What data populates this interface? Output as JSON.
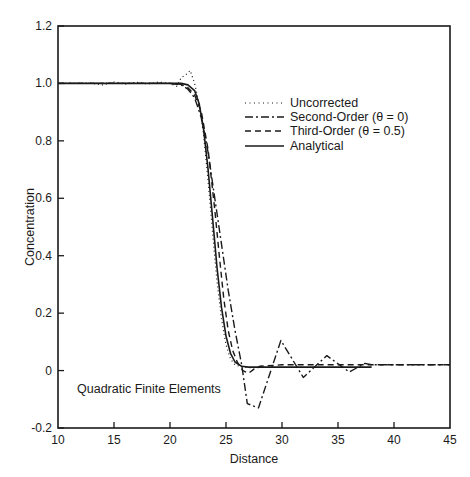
{
  "chart_data": {
    "type": "line",
    "title": "",
    "xlabel": "Distance",
    "ylabel": "Concentration",
    "xlim": [
      10,
      45
    ],
    "ylim": [
      -0.2,
      1.2
    ],
    "xticks": [
      10,
      15,
      20,
      25,
      30,
      35,
      40,
      45
    ],
    "xtick_labels": [
      "10",
      "15",
      "20",
      "25",
      "30",
      "35",
      "40",
      "45"
    ],
    "yticks": [
      -0.2,
      0,
      0.2,
      0.4,
      0.6,
      0.8,
      1.0,
      1.2
    ],
    "ytick_labels": [
      "-0.2",
      "0",
      "0.2",
      "0.4",
      "0.6",
      "0.8",
      "1.0",
      "1.2"
    ],
    "grid": false,
    "legend_position": "upper right (inside, mid-height)",
    "annotations": [
      "Quadratic Finite Elements"
    ],
    "series": [
      {
        "name": "Uncorrected",
        "style": "dotted",
        "x": [
          10,
          13,
          14,
          15,
          16,
          17,
          18,
          19,
          20,
          20.6,
          21,
          21.4,
          21.8,
          22.2,
          22.6,
          23,
          23.4,
          23.8,
          24.2,
          24.6,
          25,
          25.4,
          25.8,
          26.2,
          26.6,
          27,
          28
        ],
        "y": [
          1.0,
          1.0,
          0.995,
          1.005,
          0.997,
          1.004,
          0.998,
          1.005,
          1.0,
          0.99,
          1.02,
          1.03,
          1.045,
          1.0,
          0.93,
          0.82,
          0.66,
          0.48,
          0.31,
          0.18,
          0.09,
          0.04,
          0.02,
          0.015,
          0.012,
          0.01,
          0.01
        ]
      },
      {
        "name": "Second-Order (θ=0)",
        "style": "dash-dot",
        "x": [
          10,
          20,
          21,
          21.6,
          22.2,
          22.8,
          23.4,
          24,
          24.6,
          25.2,
          25.8,
          26.4,
          26.9,
          27.9,
          29.9,
          31.9,
          34.0,
          36.0,
          37.4,
          38,
          45
        ],
        "y": [
          1.0,
          1.0,
          0.995,
          0.98,
          0.95,
          0.88,
          0.76,
          0.6,
          0.44,
          0.28,
          0.14,
          0.02,
          -0.115,
          -0.13,
          0.105,
          -0.024,
          0.052,
          -0.005,
          0.025,
          0.02,
          0.02
        ]
      },
      {
        "name": "Third-Order (θ=0.5)",
        "style": "dashed",
        "x": [
          10,
          20,
          21,
          21.6,
          22.2,
          22.8,
          23.4,
          24,
          24.4,
          24.8,
          25.2,
          25.6,
          26,
          26.5,
          27,
          27.5,
          28,
          30,
          35,
          40,
          45
        ],
        "y": [
          1.0,
          1.0,
          0.997,
          0.985,
          0.96,
          0.9,
          0.77,
          0.56,
          0.4,
          0.25,
          0.14,
          0.07,
          0.03,
          0.0,
          -0.01,
          0.005,
          0.015,
          0.02,
          0.02,
          0.02,
          0.02
        ]
      },
      {
        "name": "Analytical",
        "style": "solid",
        "x": [
          10,
          20,
          21,
          21.6,
          22.2,
          22.6,
          23,
          23.4,
          23.8,
          24.2,
          24.6,
          25,
          25.4,
          25.8,
          26.4,
          27,
          28,
          30,
          35,
          38
        ],
        "y": [
          1.0,
          1.0,
          1.0,
          0.995,
          0.975,
          0.93,
          0.84,
          0.7,
          0.53,
          0.36,
          0.22,
          0.12,
          0.06,
          0.03,
          0.015,
          0.012,
          0.012,
          0.012,
          0.012,
          0.012
        ]
      }
    ]
  },
  "legend": {
    "items": [
      {
        "label": "Uncorrected",
        "style": "dotted"
      },
      {
        "label": "Second-Order (θ = 0)",
        "style": "dash-dot"
      },
      {
        "label": "Third-Order (θ = 0.5)",
        "style": "dashed"
      },
      {
        "label": "Analytical",
        "style": "solid"
      }
    ]
  },
  "annotation": {
    "text": "Quadratic Finite Elements"
  },
  "colors": {
    "ink": "#1a1a1a",
    "background": "#ffffff"
  }
}
